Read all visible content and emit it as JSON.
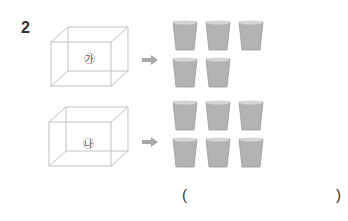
{
  "question": {
    "number": "2",
    "items": [
      {
        "label": "㉮",
        "cup_count": 5
      },
      {
        "label": "㉯",
        "cup_count": 6
      }
    ],
    "answer_open": "(",
    "answer_close": ")"
  },
  "colors": {
    "box_line": "#bdbdbd",
    "arrow": "#a8a8a8",
    "cup_fill": "#b0b0b0",
    "text": "#333333"
  }
}
